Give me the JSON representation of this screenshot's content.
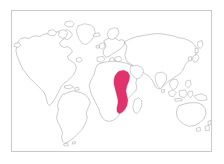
{
  "figure": {
    "type": "distribution-map",
    "title": "",
    "caption": "",
    "width": 224,
    "height": 164,
    "background_color": "#ffffff"
  },
  "frame": {
    "border_color": "#c9c9c9",
    "border_width": 1,
    "fill_color": "#ffffff",
    "left": 11,
    "top": 10,
    "width": 201,
    "height": 142
  },
  "map": {
    "projection_hint": "equirectangular-world",
    "outline_color": "#8a8a8a",
    "land_fill": "#ffffff",
    "continents": [
      {
        "name": "north-america",
        "label": "North America"
      },
      {
        "name": "south-america",
        "label": "South America"
      },
      {
        "name": "europe",
        "label": "Europe"
      },
      {
        "name": "africa",
        "label": "Africa"
      },
      {
        "name": "asia",
        "label": "Asia"
      },
      {
        "name": "australia",
        "label": "Australia"
      },
      {
        "name": "greenland",
        "label": "Greenland"
      },
      {
        "name": "madagascar",
        "label": "Madagascar"
      },
      {
        "name": "japan",
        "label": "Japan"
      },
      {
        "name": "new-zealand",
        "label": "New Zealand"
      },
      {
        "name": "british-isles",
        "label": "British Isles"
      },
      {
        "name": "indonesia",
        "label": "Indonesia"
      }
    ]
  },
  "highlight": {
    "name": "east-africa-range",
    "label": "Highlighted distribution range",
    "region_description": "East African corridor from Kenya and Tanzania south through Malawi and Mozambique",
    "fill_color": "#e2326c",
    "stroke_color": "#d02060",
    "legend_text": ""
  },
  "legend": {
    "visible": false,
    "items": []
  },
  "annotations": []
}
